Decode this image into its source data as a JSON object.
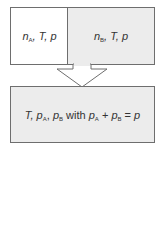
{
  "diagram": {
    "top_left": {
      "var": "n",
      "sub": "A",
      "rest": ", T, p"
    },
    "top_right": {
      "var": "n",
      "sub": "B",
      "rest": ", T, p"
    },
    "bottom": {
      "t": "T, ",
      "pa": "p",
      "pa_sub": "A",
      "sep": ", ",
      "pb": "p",
      "pb_sub": "B",
      "with": " with ",
      "pa2": "p",
      "pa2_sub": "A",
      "plus": " + ",
      "pb2": "p",
      "pb2_sub": "B",
      "eq": " = ",
      "p": "p"
    },
    "arrow": {
      "direction": "down"
    },
    "colors": {
      "border": "#6e6e6e",
      "fill_gray": "#ececec",
      "fill_white": "#ffffff"
    }
  }
}
